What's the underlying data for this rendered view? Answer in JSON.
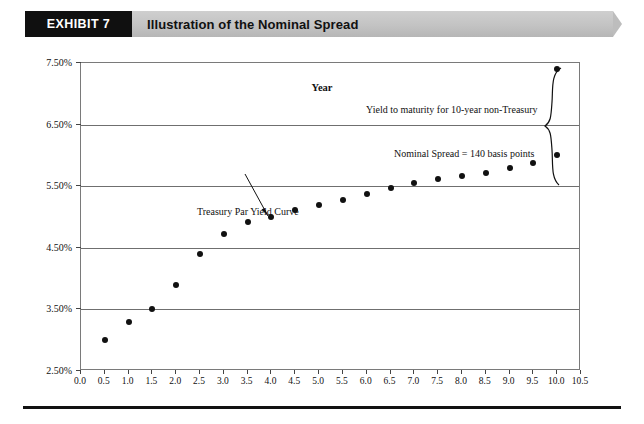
{
  "header": {
    "tag": "EXHIBIT 7",
    "title": "Illustration of the Nominal Spread"
  },
  "chart_data": {
    "type": "scatter",
    "title": "Illustration of the Nominal Spread",
    "xlabel": "Year",
    "ylabel": "",
    "xlim": [
      0.0,
      10.5
    ],
    "ylim": [
      2.5,
      7.5
    ],
    "grid": true,
    "legend": "none",
    "x_ticks": [
      "0.0",
      "0.5",
      "1.0",
      "1.5",
      "2.0",
      "2.5",
      "3.0",
      "3.5",
      "4.0",
      "4.5",
      "5.0",
      "5.5",
      "6.0",
      "6.5",
      "7.0",
      "7.5",
      "8.0",
      "8.5",
      "9.0",
      "9.5",
      "10.0",
      "10.5"
    ],
    "y_ticks": [
      "2.50%",
      "3.50%",
      "4.50%",
      "5.50%",
      "6.50%",
      "7.50%"
    ],
    "series": [
      {
        "name": "Treasury Par Yield Curve",
        "x": [
          0.5,
          1.0,
          1.5,
          2.0,
          2.5,
          3.0,
          3.5,
          4.0,
          4.5,
          5.0,
          5.5,
          6.0,
          6.5,
          7.0,
          7.5,
          8.0,
          8.5,
          9.0,
          9.5,
          10.0
        ],
        "values": [
          3.0,
          3.3,
          3.5,
          3.9,
          4.4,
          4.72,
          4.92,
          5.0,
          5.12,
          5.2,
          5.28,
          5.38,
          5.47,
          5.55,
          5.62,
          5.67,
          5.72,
          5.79,
          5.88,
          6.0
        ]
      },
      {
        "name": "Yield to maturity for 10-year non-Treasury",
        "x": [
          10.0
        ],
        "values": [
          7.4
        ]
      }
    ],
    "annotations": [
      {
        "id": "ytm",
        "text": "Yield to maturity for 10-year non-Treasury"
      },
      {
        "id": "spread",
        "text": "Nominal Spread = 140 basis points"
      },
      {
        "id": "curve",
        "text": "Treasury Par Yield Curve"
      }
    ],
    "xaxis_title": "Year"
  },
  "colors": {
    "tag_background": "#101010",
    "band_background": "#c3c3c3",
    "marker": "#111111",
    "gridline": "#6f6f6f",
    "frame": "#7a7a7a",
    "rule": "#111111"
  }
}
